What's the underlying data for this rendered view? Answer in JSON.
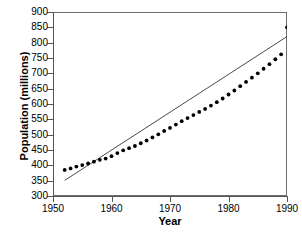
{
  "chart_data": {
    "type": "scatter",
    "title": "",
    "xlabel": "Year",
    "ylabel": "Population (millions)",
    "xlim": [
      1950,
      1990
    ],
    "ylim": [
      300,
      900
    ],
    "xticks": [
      1950,
      1960,
      1970,
      1980,
      1990
    ],
    "yticks": [
      300,
      350,
      400,
      450,
      500,
      550,
      600,
      650,
      700,
      750,
      800,
      850,
      900
    ],
    "grid": false,
    "legend": false,
    "series": [
      {
        "name": "Population",
        "marker": "filled-circle",
        "color": "#000000",
        "x": [
          1952,
          1953,
          1954,
          1955,
          1956,
          1957,
          1958,
          1959,
          1960,
          1961,
          1962,
          1963,
          1964,
          1965,
          1966,
          1967,
          1968,
          1969,
          1970,
          1971,
          1972,
          1973,
          1974,
          1975,
          1976,
          1977,
          1978,
          1979,
          1980,
          1981,
          1982,
          1983,
          1984,
          1985,
          1986,
          1987,
          1988,
          1989,
          1990
        ],
        "values": [
          385,
          390,
          396,
          401,
          406,
          412,
          418,
          422,
          430,
          440,
          449,
          456,
          463,
          472,
          481,
          491,
          501,
          512,
          522,
          533,
          544,
          554,
          564,
          574,
          584,
          595,
          606,
          618,
          631,
          644,
          658,
          672,
          686,
          700,
          715,
          730,
          746,
          762,
          850
        ]
      },
      {
        "name": "Linear trend",
        "marker": "none",
        "style": "solid-line",
        "color": "#4a4a4a",
        "x": [
          1952,
          1990
        ],
        "values": [
          351,
          820
        ]
      }
    ]
  },
  "axes": {
    "y_title": "Population (millions)",
    "x_title": "Year",
    "y_tick_labels": [
      "900",
      "850",
      "800",
      "750",
      "700",
      "650",
      "600",
      "550",
      "500",
      "450",
      "400",
      "350",
      "300"
    ],
    "x_tick_labels": [
      "1950",
      "1960",
      "1970",
      "1980",
      "1990"
    ]
  }
}
